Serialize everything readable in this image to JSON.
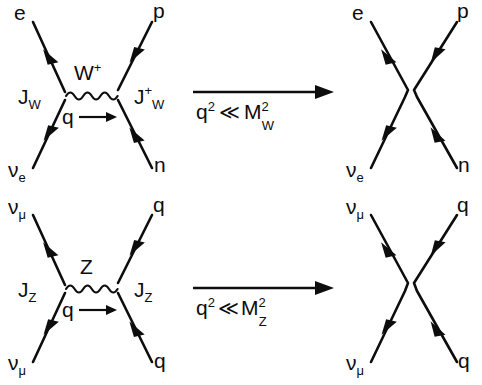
{
  "figure": {
    "background_color": "#ffffff",
    "line_color": "#0d0d0d"
  },
  "panels": [
    {
      "id": "top-left",
      "kind": "exchange-diagram",
      "boson": {
        "label": "W",
        "superscript": "+"
      },
      "propagator_style": "wavy",
      "momentum": {
        "label": "q",
        "arrow": "right"
      },
      "currents": [
        {
          "label": "J",
          "subscript": "W",
          "superscript": "",
          "side": "left"
        },
        {
          "label": "J",
          "subscript": "W",
          "superscript": "+",
          "side": "right"
        }
      ],
      "legs": [
        {
          "name": "e",
          "position": "top-left",
          "arrow": "into-vertex"
        },
        {
          "name": "p",
          "position": "top-right",
          "arrow": "out-of-vertex"
        },
        {
          "name": "v",
          "subscript": "e",
          "position": "bottom-left",
          "arrow": "into-vertex"
        },
        {
          "name": "n",
          "position": "bottom-right",
          "arrow": "out-of-vertex"
        }
      ]
    },
    {
      "id": "top-right",
      "kind": "contact-diagram",
      "legs": [
        {
          "name": "e",
          "position": "top-left",
          "arrow": "into-vertex"
        },
        {
          "name": "p",
          "position": "top-right",
          "arrow": "out-of-vertex"
        },
        {
          "name": "v",
          "subscript": "e",
          "position": "bottom-left",
          "arrow": "into-vertex"
        },
        {
          "name": "n",
          "position": "bottom-right",
          "arrow": "out-of-vertex"
        }
      ]
    },
    {
      "id": "bottom-left",
      "kind": "exchange-diagram",
      "boson": {
        "label": "Z",
        "superscript": ""
      },
      "propagator_style": "wavy",
      "momentum": {
        "label": "q",
        "arrow": "right"
      },
      "currents": [
        {
          "label": "J",
          "subscript": "Z",
          "superscript": "",
          "side": "left"
        },
        {
          "label": "J",
          "subscript": "Z",
          "superscript": "",
          "side": "right"
        }
      ],
      "legs": [
        {
          "name": "v",
          "subscript": "μ",
          "position": "top-left",
          "arrow": "into-vertex"
        },
        {
          "name": "q",
          "position": "top-right",
          "arrow": "out-of-vertex"
        },
        {
          "name": "v",
          "subscript": "μ",
          "position": "bottom-left",
          "arrow": "into-vertex"
        },
        {
          "name": "q",
          "position": "bottom-right",
          "arrow": "out-of-vertex"
        }
      ]
    },
    {
      "id": "bottom-right",
      "kind": "contact-diagram",
      "legs": [
        {
          "name": "v",
          "subscript": "μ",
          "position": "top-left",
          "arrow": "into-vertex"
        },
        {
          "name": "q",
          "position": "top-right",
          "arrow": "out-of-vertex"
        },
        {
          "name": "v",
          "subscript": "μ",
          "position": "bottom-left",
          "arrow": "into-vertex"
        },
        {
          "name": "q",
          "position": "bottom-right",
          "arrow": "out-of-vertex"
        }
      ]
    }
  ],
  "transitions": [
    {
      "id": "top-transition",
      "direction": "right",
      "condition": {
        "lhs_base": "q",
        "lhs_exp": "2",
        "operator": "≪",
        "rhs_base": "M",
        "rhs_exp": "2",
        "rhs_sub": "W"
      }
    },
    {
      "id": "bottom-transition",
      "direction": "right",
      "condition": {
        "lhs_base": "q",
        "lhs_exp": "2",
        "operator": "≪",
        "rhs_base": "M",
        "rhs_exp": "2",
        "rhs_sub": "Z"
      }
    }
  ],
  "labels": {
    "top_left": {
      "e": "e",
      "p": "p",
      "nu_e": "ν",
      "nu_e_sub": "e",
      "n": "n",
      "boson": "W",
      "boson_sup": "+",
      "J_left": "J",
      "J_left_sub": "W",
      "J_right": "J",
      "J_right_sub": "W",
      "J_right_sup": "+",
      "q": "q"
    },
    "top_right": {
      "e": "e",
      "p": "p",
      "nu_e": "ν",
      "nu_e_sub": "e",
      "n": "n"
    },
    "bottom_left": {
      "nu_mu_top": "ν",
      "nu_mu_top_sub": "μ",
      "q_top": "q",
      "nu_mu_bot": "ν",
      "nu_mu_bot_sub": "μ",
      "q_bot": "q",
      "boson": "Z",
      "J_left": "J",
      "J_left_sub": "Z",
      "J_right": "J",
      "J_right_sub": "Z",
      "q": "q"
    },
    "bottom_right": {
      "nu_mu_top": "ν",
      "nu_mu_top_sub": "μ",
      "q_top": "q",
      "nu_mu_bot": "ν",
      "nu_mu_bot_sub": "μ",
      "q_bot": "q"
    },
    "top_arrow": {
      "q": "q",
      "q_exp": "2",
      "op": "≪",
      "M": "M",
      "M_exp": "2",
      "M_sub": "W"
    },
    "bottom_arrow": {
      "q": "q",
      "q_exp": "2",
      "op": "≪",
      "M": "M",
      "M_exp": "2",
      "M_sub": "Z"
    }
  }
}
